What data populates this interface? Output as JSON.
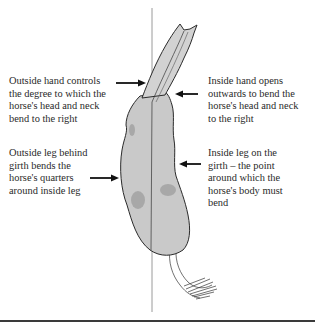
{
  "diagram": {
    "annotations": [
      {
        "id": "outside-hand",
        "side": "left",
        "text": "Outside hand controls\nthe degree to which the\nhorse's head and neck\nbend to the right",
        "arrow": "right"
      },
      {
        "id": "outside-leg",
        "side": "left",
        "text": "Outside leg behind\ngirth bends the\nhorse's quarters\naround inside leg",
        "arrow": "right"
      },
      {
        "id": "inside-hand",
        "side": "right",
        "text": "Inside hand opens\noutwards to bend the\nhorse's head and neck\nto the right",
        "arrow": "left"
      },
      {
        "id": "inside-leg",
        "side": "right",
        "text": "Inside leg on the\ngirth – the point\naround which the\nhorse's body must\nbend",
        "arrow": "left"
      }
    ],
    "colors": {
      "horse_fill": "#c9c9c9",
      "horse_outline": "#2b2b2b",
      "centre_line": "#9a9a9a",
      "arrow": "#111111",
      "rule": "#3a3a3a"
    }
  }
}
